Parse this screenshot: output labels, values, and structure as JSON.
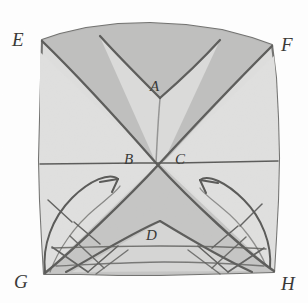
{
  "figure": {
    "medium": "pencil on paper",
    "colors": {
      "paper": "#fdfdfc",
      "sheet_light": "#dedede",
      "sheet_mid": "#d2d2d2",
      "band_dark": "#b9b9b9",
      "band_darker": "#b0b0b0",
      "ink": "#575755",
      "ink_soft": "#6f6f6d",
      "label_ink": "#3a3a38"
    },
    "labels": {
      "E": "E",
      "F": "F",
      "G": "G",
      "H": "H",
      "A": "A",
      "B": "B",
      "C": "C",
      "D": "D"
    },
    "label_roles": {
      "E": "top-left-corner-vertex",
      "F": "top-right-corner-vertex",
      "G": "bottom-left-corner-vertex",
      "H": "bottom-right-corner-vertex",
      "A": "upper-v-band-apex",
      "B": "left-of-centre-crossing",
      "C": "right-of-centre-crossing",
      "D": "lower-inner-triangle-apex"
    },
    "elements": {
      "sheet_outline": "square-sheet-outline",
      "upper_band": "upper-v-shaped-shaded-band",
      "lower_triangle": "lower-shaded-triangle",
      "inner_peak": "inner-triangular-peak-D",
      "median_line": "horizontal-centre-line",
      "arrow_left": "left-curved-arrow-pointing-up-right",
      "arrow_right": "right-curved-arrow-pointing-up-left",
      "hatch_marks": "short-cross-hatch-tick-marks",
      "zigzag": "bottom-zigzag-crease-lines"
    },
    "geometry": {
      "crossing_point": [
        156,
        163
      ],
      "corner_E": [
        42,
        40
      ],
      "corner_F": [
        272,
        45
      ],
      "corner_G": [
        44,
        274
      ],
      "corner_H": [
        274,
        272
      ],
      "apex_A": [
        160,
        98
      ],
      "apex_D": [
        160,
        222
      ],
      "median_y": 163
    }
  }
}
